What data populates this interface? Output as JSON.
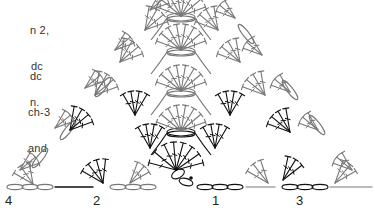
{
  "instructions": {
    "block_a": [
      "n 2,",
      "dc",
      "n."
    ],
    "block_b": [
      "dc",
      "ch-3",
      "and"
    ]
  },
  "row_labels": [
    {
      "label": "4",
      "x": 5,
      "y": 195
    },
    {
      "label": "2",
      "x": 93,
      "y": 195
    },
    {
      "label": "1",
      "x": 212,
      "y": 195
    },
    {
      "label": "3",
      "x": 296,
      "y": 195
    }
  ],
  "colors": {
    "dark_stitch": "#111111",
    "gray_stitch": "#777777"
  },
  "chart": {
    "apex": [
      214,
      -14
    ],
    "base_y": 184,
    "rows": [
      {
        "row": 1,
        "color": "dark",
        "center": [
          181,
          176
        ],
        "loop_pairs": 1
      },
      {
        "row": 2,
        "color": "dark",
        "center": [
          181,
          133
        ],
        "loop_pairs": 1
      },
      {
        "row": 3,
        "color": "gray",
        "center": [
          181,
          93
        ],
        "loop_pairs": 1
      },
      {
        "row": 4,
        "color": "gray",
        "center": [
          181,
          51
        ],
        "loop_pairs": 1
      }
    ]
  }
}
